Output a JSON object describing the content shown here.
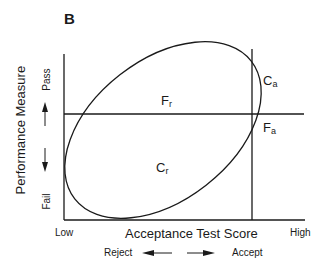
{
  "panel": {
    "label": "B"
  },
  "axes": {
    "y_title": "Performance Measure",
    "y_top": "Pass",
    "y_bottom": "Fail",
    "x_title": "Acceptance Test Score",
    "x_left": "Low",
    "x_right": "High",
    "x_arrow_left": "Reject",
    "x_arrow_right": "Accept"
  },
  "regions": {
    "false_reject": {
      "main": "F",
      "sub": "r"
    },
    "correct_reject": {
      "main": "C",
      "sub": "r"
    },
    "correct_accept": {
      "main": "C",
      "sub": "a"
    },
    "false_accept": {
      "main": "F",
      "sub": "a"
    }
  },
  "colors": {
    "ink": "#1a1a1a",
    "background": "#ffffff"
  }
}
